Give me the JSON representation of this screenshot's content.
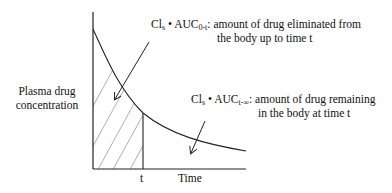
{
  "diagram": {
    "y_axis_label_line1": "Plasma drug",
    "y_axis_label_line2": "concentration",
    "x_axis_label": "Time",
    "time_marker": "t",
    "annotation_eliminated": {
      "prefix": "Cl",
      "prefix_sub": "s",
      "bullet": "•",
      "auc": "AUC",
      "auc_sub": "0-t",
      "line1_text": ": amount of drug eliminated from",
      "line2_text": "the body up to time t"
    },
    "annotation_remaining": {
      "prefix": "Cl",
      "prefix_sub": "s",
      "bullet": "•",
      "auc": "AUC",
      "auc_sub": "t-∞",
      "line1_text": ": amount of drug remaining",
      "line2_text": "in the body at time t"
    },
    "colors": {
      "line": "#222222",
      "hatch": "#9a9a9a",
      "background": "#ffffff"
    }
  }
}
